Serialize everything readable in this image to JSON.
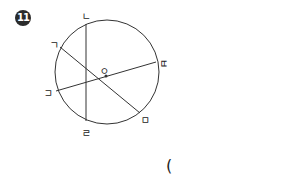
{
  "problem": {
    "number": "11",
    "answer_open_paren": "("
  },
  "diagram": {
    "center_label": "ㅇ",
    "point_labels": {
      "top": "ㄱ",
      "upper_left": "ㄴ",
      "left": "ㄷ",
      "bottom": "ㄹ",
      "lower_right": "ㅁ",
      "right": "ㅂ"
    },
    "stroke_color": "#333333"
  }
}
